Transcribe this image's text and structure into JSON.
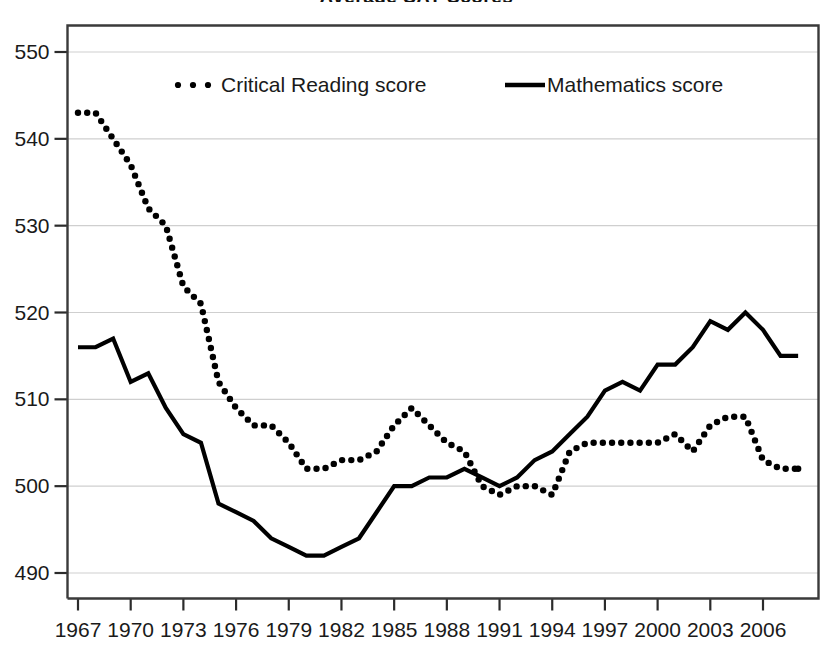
{
  "chart_data": {
    "type": "line",
    "title": "Average SAT Scores",
    "xlabel": "",
    "ylabel": "",
    "xlim": [
      1967,
      2008
    ],
    "ylim": [
      487,
      553
    ],
    "yticks": [
      490,
      500,
      510,
      520,
      530,
      540,
      550
    ],
    "xticks": [
      1967,
      1970,
      1973,
      1976,
      1979,
      1982,
      1985,
      1988,
      1991,
      1994,
      1997,
      2000,
      2003,
      2006
    ],
    "grid": true,
    "legend_position": "top-inside",
    "x": [
      1967,
      1968,
      1969,
      1970,
      1971,
      1972,
      1973,
      1974,
      1975,
      1976,
      1977,
      1978,
      1979,
      1980,
      1981,
      1982,
      1983,
      1984,
      1985,
      1986,
      1987,
      1988,
      1989,
      1990,
      1991,
      1992,
      1993,
      1994,
      1995,
      1996,
      1997,
      1998,
      1999,
      2000,
      2001,
      2002,
      2003,
      2004,
      2005,
      2006,
      2007,
      2008
    ],
    "series": [
      {
        "name": "Critical Reading score",
        "style": "dotted",
        "values": [
          543,
          543,
          540,
          537,
          532,
          530,
          523,
          521,
          512,
          509,
          507,
          507,
          505,
          502,
          502,
          503,
          503,
          504,
          507,
          509,
          507,
          505,
          504,
          500,
          499,
          500,
          500,
          499,
          504,
          505,
          505,
          505,
          505,
          505,
          506,
          504,
          507,
          508,
          508,
          503,
          502,
          502
        ]
      },
      {
        "name": "Mathematics score",
        "style": "solid",
        "values": [
          516,
          516,
          517,
          512,
          513,
          509,
          506,
          505,
          498,
          497,
          496,
          494,
          493,
          492,
          492,
          493,
          494,
          497,
          500,
          500,
          501,
          501,
          502,
          501,
          500,
          501,
          503,
          504,
          506,
          508,
          511,
          512,
          511,
          514,
          514,
          516,
          519,
          518,
          520,
          518,
          515,
          515
        ]
      }
    ]
  },
  "legend": {
    "items": [
      {
        "label": "Critical Reading score",
        "marker": "dotted-line-marker"
      },
      {
        "label": "Mathematics score",
        "marker": "solid-line-marker"
      }
    ]
  },
  "colors": {
    "series_math": "#000000",
    "series_critical_reading": "#000000",
    "gridline": "#cfcfcf",
    "axis": "#3a3a3a",
    "background": "#ffffff"
  }
}
